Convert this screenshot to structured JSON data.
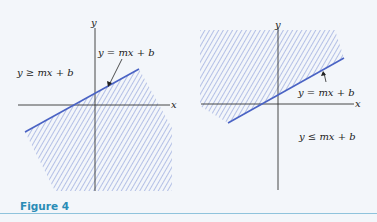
{
  "figure": {
    "caption": "Figure 4",
    "colors": {
      "background": "#f3f6fa",
      "boundary_line": "#4a63c4",
      "hatch": "#7f93d4",
      "axis": "#333333",
      "caption": "#2a8cb6",
      "rule": "#8fc3dc"
    },
    "panels": [
      {
        "id": "left",
        "x_axis_label": "x",
        "y_axis_label": "y",
        "boundary_label": "y = mx + b",
        "region_label": "y ≥ mx + b",
        "shaded_side": "below line (hatched region)"
      },
      {
        "id": "right",
        "x_axis_label": "x",
        "y_axis_label": "y",
        "boundary_label": "y = mx + b",
        "region_label": "y ≤ mx + b",
        "shaded_side": "above line (hatched region)"
      }
    ]
  }
}
